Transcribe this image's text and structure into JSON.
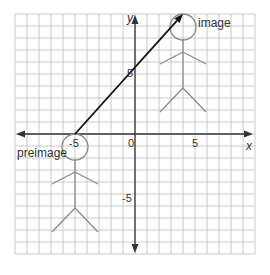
{
  "diagram": {
    "type": "coordinate-plane-translation",
    "grid": {
      "unit_px": 12,
      "origin_px": [
        135,
        134
      ],
      "x_range": [
        -10,
        10
      ],
      "y_range": [
        -10,
        10
      ],
      "line_color": "#bdbdbd",
      "axis_color": "#333333"
    },
    "axes": {
      "x_label": "x",
      "y_label": "y",
      "ticks": {
        "x_neg": "-5",
        "x_pos": "5",
        "origin": "0",
        "y_pos": "5",
        "y_neg": "-5"
      }
    },
    "figures": {
      "preimage": {
        "label": "preimage",
        "head_top_xy": [
          -5,
          0
        ],
        "color": "#8a8a8a"
      },
      "image": {
        "label": "image",
        "head_top_xy": [
          4,
          10
        ],
        "color": "#8a8a8a"
      }
    },
    "translation_arrow": {
      "from": [
        -5,
        0
      ],
      "to": [
        4,
        10
      ],
      "color": "#111111"
    }
  }
}
